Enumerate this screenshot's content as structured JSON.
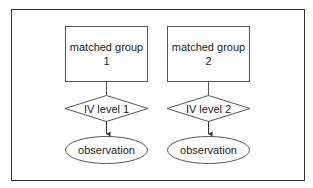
{
  "diagram": {
    "colors": {
      "stroke": "#555555",
      "frame": "#333333",
      "text": "#222222",
      "fill": "#ffffff"
    },
    "columns": [
      {
        "group": {
          "line1": "matched group",
          "line2": "1"
        },
        "condition": "IV level 1",
        "outcome": "observation"
      },
      {
        "group": {
          "line1": "matched group",
          "line2": "2"
        },
        "condition": "IV level 2",
        "outcome": "observation"
      }
    ]
  }
}
